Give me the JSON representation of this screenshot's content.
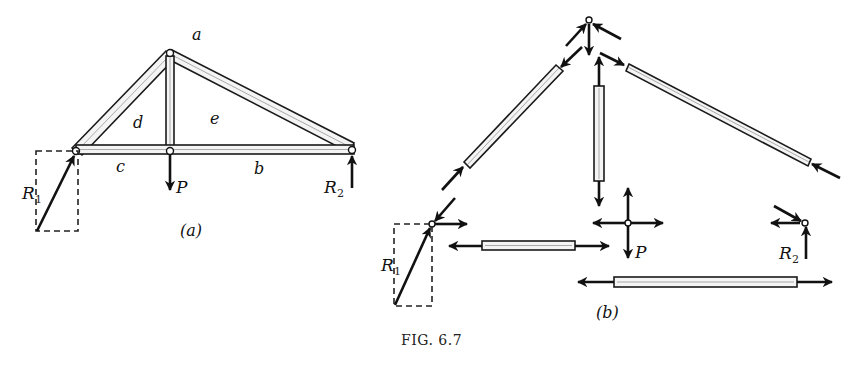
{
  "figure": {
    "caption": "Fig. 6.7",
    "caption_display": "FIG. 6.7"
  },
  "part_a": {
    "label": "(a)",
    "space_labels": {
      "a": "a",
      "b": "b",
      "c": "c",
      "d": "d",
      "e": "e"
    },
    "loads": {
      "P": "P",
      "R1": "R",
      "R1_sub": "1",
      "R2": "R",
      "R2_sub": "2"
    }
  },
  "part_b": {
    "label": "(b)",
    "loads": {
      "P": "P",
      "R1": "R",
      "R1_sub": "1",
      "R2": "R",
      "R2_sub": "2"
    }
  },
  "colors": {
    "ink": "#111111",
    "member_fill": "#f4f4f4",
    "background": "#ffffff"
  }
}
